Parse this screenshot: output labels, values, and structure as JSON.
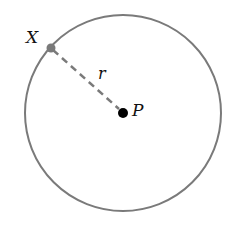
{
  "diagram": {
    "type": "circle-radius",
    "circle": {
      "cx": 123,
      "cy": 113,
      "r": 98,
      "stroke": "#7a7a7a"
    },
    "point_x": {
      "label": "X",
      "x": 51,
      "y": 48,
      "color": "#7a7a7a"
    },
    "point_p": {
      "label": "P",
      "x": 123,
      "y": 113,
      "color": "#000000"
    },
    "radius_label": "r"
  }
}
